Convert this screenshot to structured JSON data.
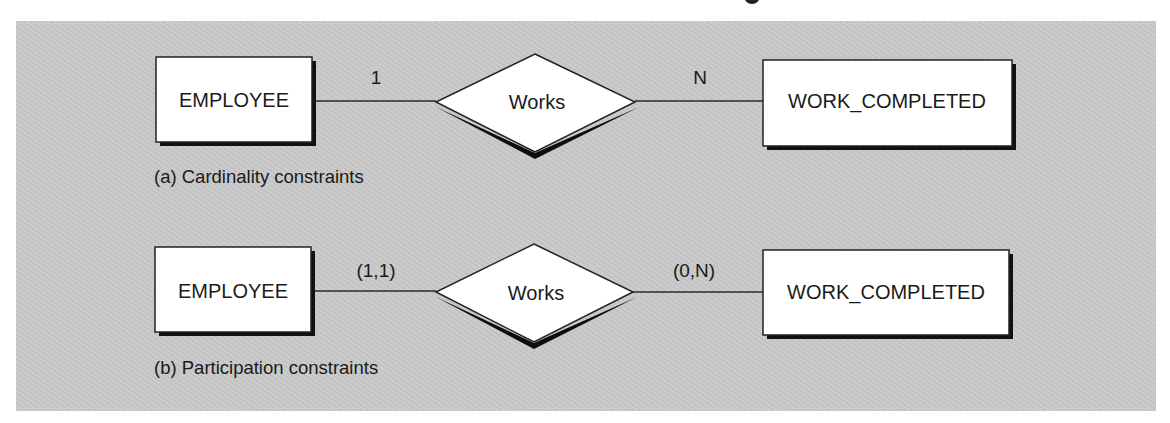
{
  "figure": {
    "background_color": "#c9c9c9",
    "diagrams": [
      {
        "id": "a",
        "caption": "(a)  Cardinality constraints",
        "left_entity": "EMPLOYEE",
        "relationship": "Works",
        "right_entity": "WORK_COMPLETED",
        "left_label": "1",
        "right_label": "N"
      },
      {
        "id": "b",
        "caption": "(b)  Participation constraints",
        "left_entity": "EMPLOYEE",
        "relationship": "Works",
        "right_entity": "WORK_COMPLETED",
        "left_label": "(1,1)",
        "right_label": "(0,N)"
      }
    ]
  }
}
